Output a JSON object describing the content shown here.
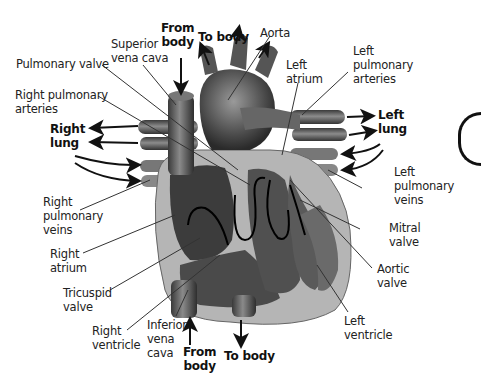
{
  "diagram": {
    "style": "grayscale",
    "colors": {
      "background": "#ffffff",
      "text": "#222222",
      "leader_line": "#333333",
      "arrow": "#111111"
    },
    "labels": {
      "from_body_top": {
        "lines": [
          "From",
          "body"
        ],
        "bold": true
      },
      "to_body_top": {
        "lines": [
          "To body"
        ],
        "bold": true
      },
      "aorta": {
        "lines": [
          "Aorta"
        ]
      },
      "superior_vena_cava": {
        "lines": [
          "Superior",
          "vena cava"
        ]
      },
      "pulmonary_valve": {
        "lines": [
          "Pulmonary valve"
        ]
      },
      "right_pulmonary_arteries": {
        "lines": [
          "Right pulmonary",
          "arteries"
        ]
      },
      "right_lung": {
        "lines": [
          "Right",
          "lung"
        ],
        "bold": true
      },
      "right_pulmonary_veins": {
        "lines": [
          "Right",
          "pulmonary",
          "veins"
        ]
      },
      "right_atrium": {
        "lines": [
          "Right",
          "atrium"
        ]
      },
      "tricuspid_valve": {
        "lines": [
          "Tricuspid",
          "valve"
        ]
      },
      "right_ventricle": {
        "lines": [
          "Right",
          "ventricle"
        ]
      },
      "inferior_vena_cava": {
        "lines": [
          "Inferior",
          "vena",
          "cava"
        ]
      },
      "from_body_bottom": {
        "lines": [
          "From",
          "body"
        ],
        "bold": true
      },
      "to_body_bottom": {
        "lines": [
          "To body"
        ],
        "bold": true
      },
      "left_atrium": {
        "lines": [
          "Left",
          "atrium"
        ]
      },
      "left_pulmonary_arteries": {
        "lines": [
          "Left",
          "pulmonary",
          "arteries"
        ]
      },
      "left_lung": {
        "lines": [
          "Left",
          "lung"
        ],
        "bold": true
      },
      "left_pulmonary_veins": {
        "lines": [
          "Left",
          "pulmonary",
          "veins"
        ]
      },
      "mitral_valve": {
        "lines": [
          "Mitral",
          "valve"
        ]
      },
      "aortic_valve": {
        "lines": [
          "Aortic",
          "valve"
        ]
      },
      "left_ventricle": {
        "lines": [
          "Left",
          "ventricle"
        ]
      }
    }
  }
}
